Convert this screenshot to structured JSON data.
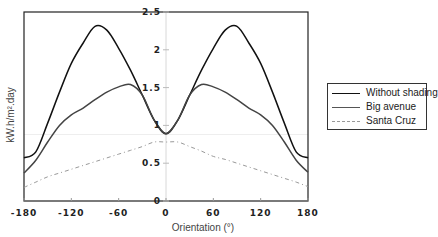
{
  "chart_data": {
    "type": "line",
    "title": "",
    "xlabel": "Orientation (°)",
    "ylabel": "kW.h/m².day",
    "xlim": [
      -180,
      180
    ],
    "ylim": [
      0,
      2.5
    ],
    "xticks": [
      "-180",
      "-120",
      "-60",
      "0",
      "60",
      "120",
      "180"
    ],
    "yticks": [
      "0",
      "0.5",
      "1",
      "1.5",
      "2",
      "2.5"
    ],
    "grid": false,
    "legend_position": "right",
    "x": [
      -180,
      -165,
      -150,
      -135,
      -120,
      -105,
      -90,
      -75,
      -60,
      -45,
      -30,
      -15,
      0,
      15,
      30,
      45,
      60,
      75,
      90,
      105,
      120,
      135,
      150,
      165,
      180
    ],
    "series": [
      {
        "name": "Without shading",
        "style": "solid",
        "color": "#111111",
        "values": [
          0.57,
          0.65,
          1.03,
          1.44,
          1.82,
          2.09,
          2.31,
          2.26,
          2.02,
          1.73,
          1.4,
          1.07,
          0.89,
          1.07,
          1.4,
          1.73,
          2.02,
          2.26,
          2.31,
          2.09,
          1.82,
          1.44,
          1.03,
          0.65,
          0.57
        ]
      },
      {
        "name": "Big avenue",
        "style": "solid",
        "color": "#444444",
        "values": [
          0.37,
          0.54,
          0.78,
          1.0,
          1.14,
          1.23,
          1.34,
          1.44,
          1.51,
          1.54,
          1.4,
          1.07,
          0.89,
          1.07,
          1.4,
          1.54,
          1.51,
          1.44,
          1.34,
          1.23,
          1.14,
          1.0,
          0.78,
          0.54,
          0.38
        ]
      },
      {
        "name": "Santa Cruz",
        "style": "dashdot",
        "color": "#999999",
        "values": [
          0.18,
          0.25,
          0.32,
          0.37,
          0.42,
          0.47,
          0.52,
          0.57,
          0.62,
          0.67,
          0.72,
          0.78,
          0.78,
          0.78,
          0.72,
          0.66,
          0.59,
          0.55,
          0.5,
          0.45,
          0.4,
          0.35,
          0.3,
          0.25,
          0.19
        ]
      }
    ]
  },
  "legend": {
    "items": [
      {
        "label": "Without shading"
      },
      {
        "label": "Big avenue"
      },
      {
        "label": "Santa Cruz"
      }
    ]
  }
}
